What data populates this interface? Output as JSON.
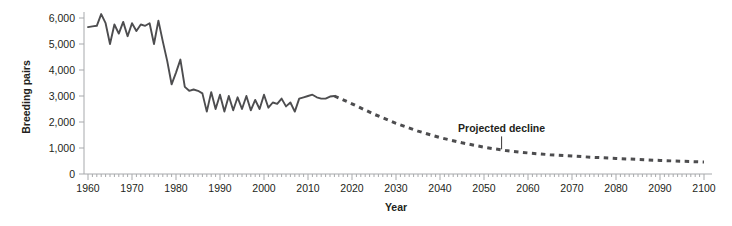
{
  "chart_data": {
    "type": "line",
    "title": "",
    "subtitle": "",
    "xlabel": "Year",
    "ylabel": "Breeding pairs",
    "xlim": [
      1960,
      2100
    ],
    "ylim": [
      0,
      6200
    ],
    "grid": false,
    "legend": null,
    "x_tick_labels": [
      "1960",
      "1970",
      "1980",
      "1990",
      "2000",
      "2010",
      "2020",
      "2030",
      "2040",
      "2050",
      "2060",
      "2070",
      "2080",
      "2090",
      "2100"
    ],
    "x_ticks": [
      1960,
      1970,
      1980,
      1990,
      2000,
      2010,
      2020,
      2030,
      2040,
      2050,
      2060,
      2070,
      2080,
      2090,
      2100
    ],
    "x_minor_tick_interval": 1,
    "y_tick_labels": [
      "0",
      "1,000",
      "2,000",
      "3,000",
      "4,000",
      "5,000",
      "6,000"
    ],
    "y_ticks": [
      0,
      1000,
      2000,
      3000,
      4000,
      5000,
      6000
    ],
    "series": [
      {
        "name": "Observed breeding pairs",
        "style": "solid",
        "color": "#4d4d4f",
        "x": [
          1960,
          1961,
          1962,
          1963,
          1964,
          1965,
          1966,
          1967,
          1968,
          1969,
          1970,
          1971,
          1972,
          1973,
          1974,
          1975,
          1976,
          1977,
          1978,
          1979,
          1980,
          1981,
          1982,
          1983,
          1984,
          1985,
          1986,
          1987,
          1988,
          1989,
          1990,
          1991,
          1992,
          1993,
          1994,
          1995,
          1996,
          1997,
          1998,
          1999,
          2000,
          2001,
          2002,
          2003,
          2004,
          2005,
          2006,
          2007,
          2008,
          2009,
          2010,
          2011,
          2012,
          2013,
          2014,
          2015,
          2016
        ],
        "values": [
          5650,
          5680,
          5700,
          6150,
          5800,
          5000,
          5750,
          5400,
          5850,
          5300,
          5800,
          5500,
          5750,
          5700,
          5800,
          5000,
          5900,
          5100,
          4350,
          3450,
          3900,
          4400,
          3350,
          3200,
          3250,
          3200,
          3100,
          2400,
          3150,
          2500,
          3050,
          2400,
          3000,
          2450,
          2950,
          2500,
          3000,
          2450,
          2850,
          2500,
          3050,
          2550,
          2750,
          2700,
          2900,
          2600,
          2750,
          2400,
          2900,
          2950,
          3000,
          3050,
          2950,
          2900,
          2900,
          2980,
          3000
        ]
      },
      {
        "name": "Projected decline",
        "style": "dotted",
        "color": "#4d4d4f",
        "x": [
          2016,
          2020,
          2025,
          2030,
          2035,
          2040,
          2045,
          2050,
          2055,
          2060,
          2065,
          2070,
          2075,
          2080,
          2085,
          2090,
          2095,
          2100
        ],
        "values": [
          3000,
          2700,
          2300,
          1950,
          1650,
          1400,
          1200,
          1030,
          900,
          810,
          740,
          690,
          640,
          600,
          560,
          520,
          490,
          460
        ]
      }
    ],
    "annotations": [
      {
        "text": "Projected decline",
        "x": 2054,
        "y": 1600,
        "leader_to_y": 950
      }
    ]
  },
  "colors": {
    "line": "#4d4d4f",
    "axis": "#a7a9ac",
    "text": "#231f20",
    "background": "#ffffff"
  }
}
